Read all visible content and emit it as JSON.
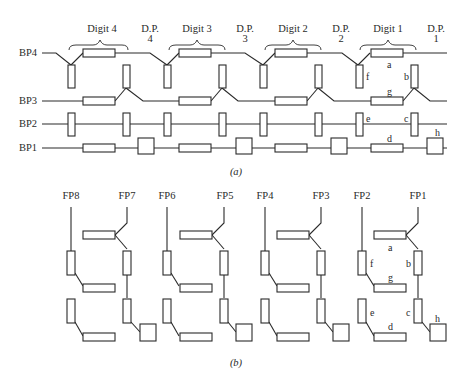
{
  "header": {
    "running_head": ""
  },
  "part_a": {
    "caption": "(a)",
    "digit_groups": [
      {
        "label": "Digit 4",
        "dp_label": "D.P.",
        "dp_number": "4"
      },
      {
        "label": "Digit  3",
        "dp_label": "D.P.",
        "dp_number": "3"
      },
      {
        "label": "Digit 2",
        "dp_label": "D.P.",
        "dp_number": "2"
      },
      {
        "label": "Digit 1",
        "dp_label": "D.P.",
        "dp_number": "1"
      }
    ],
    "backplanes": [
      "BP4",
      "BP3",
      "BP2",
      "BP1"
    ],
    "segment_labels": {
      "a": "a",
      "b": "b",
      "c": "c",
      "d": "d",
      "e": "e",
      "f": "f",
      "g": "g",
      "h": "h"
    }
  },
  "part_b": {
    "caption": "(b)",
    "frontplanes": [
      "FP8",
      "FP7",
      "FP6",
      "FP5",
      "FP4",
      "FP3",
      "FP2",
      "FP1"
    ],
    "segment_labels": {
      "a": "a",
      "b": "b",
      "c": "c",
      "d": "d",
      "e": "e",
      "f": "f",
      "g": "g",
      "h": "h"
    }
  },
  "colors": {
    "stroke": "#2a2a2a",
    "background": "#ffffff",
    "text": "#2a2a2a"
  }
}
